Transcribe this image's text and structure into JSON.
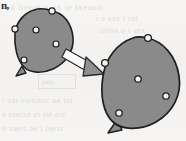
{
  "figure": {
    "corner_mark": "n,",
    "background_color": "#f4f3f1",
    "shape_fill": "#8a8a8a",
    "shape_stroke": "#1f1f1f",
    "marker_fill": "#f2f1ef",
    "marker_stroke": "#1f1f1f",
    "arrow_fill": "#fbfbfa",
    "arrow_head_fill": "#8f8f8f",
    "arrow_stroke": "#2a2a2a"
  },
  "shapes": {
    "small_blob": {
      "label": "small-blob",
      "interior_dots": 3,
      "edge_circles": 2,
      "tail": "bottom-left-nub"
    },
    "large_blob": {
      "label": "large-blob",
      "interior_dots": 3,
      "edge_circles": 2,
      "tail": "bottom-left-nub"
    }
  },
  "arrow": {
    "label": "transformation-arrow",
    "direction": "down-right"
  },
  "ghost_text": {
    "line1": "d  lteeat  u  ex  ie  txeaoit",
    "line2": "i   e   axe  t   ixt",
    "line3": "ioixa   o  t  aex",
    "line4": "i  xat  eaitieoc  oa  tat",
    "line5": "a  toeixe  et  tat  aie",
    "line6": "o  xaett  oe  i  taeix",
    "line7": "eata"
  }
}
